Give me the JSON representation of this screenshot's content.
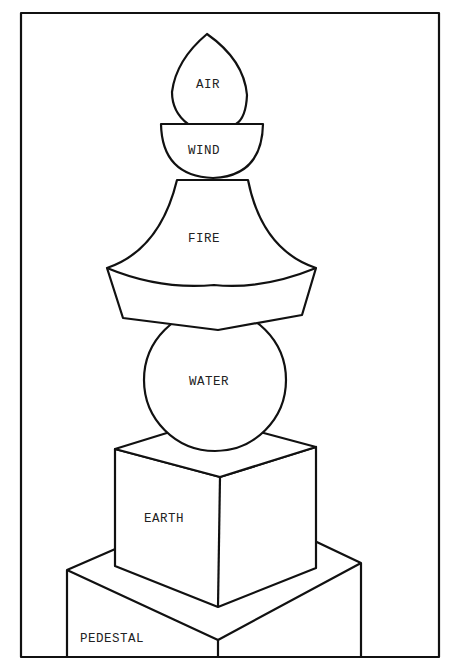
{
  "diagram": {
    "type": "five-element pagoda (gorinto)",
    "labels": {
      "air": "AIR",
      "wind": "WIND",
      "fire": "FIRE",
      "water": "WATER",
      "earth": "EARTH",
      "pedestal": "PEDESTAL"
    },
    "order_top_to_bottom": [
      "AIR",
      "WIND",
      "FIRE",
      "WATER",
      "EARTH",
      "PEDESTAL"
    ],
    "shapes": {
      "air": "jewel / teardrop",
      "wind": "hemisphere bowl",
      "fire": "pyramidal roof",
      "water": "sphere",
      "earth": "cube",
      "pedestal": "square base block"
    },
    "colors": {
      "line": "#111111",
      "background": "#ffffff"
    }
  }
}
